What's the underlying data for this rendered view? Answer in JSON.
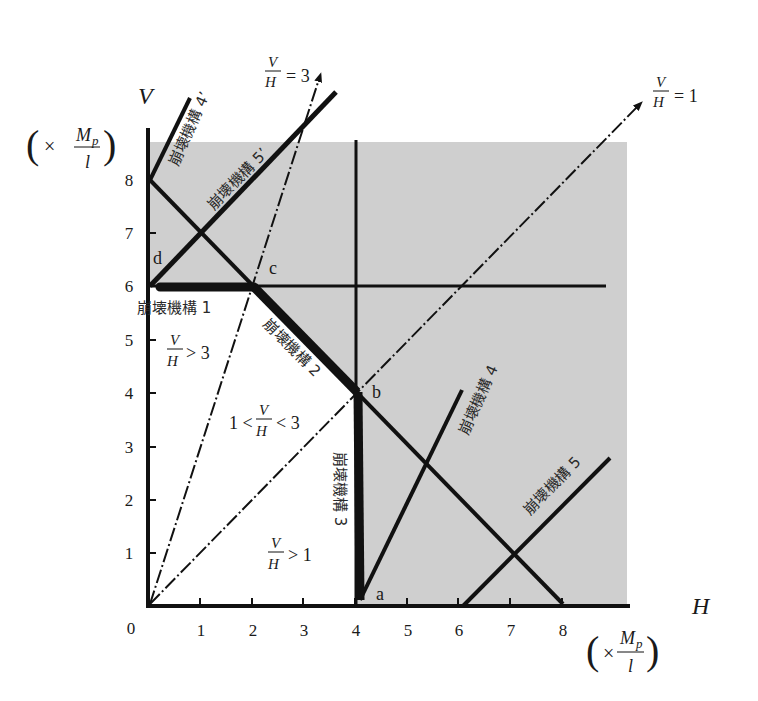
{
  "diagram": {
    "type": "interaction-diagram",
    "axes": {
      "x": {
        "label": "H",
        "unit": "(× Mp / l)",
        "ticks": [
          "0",
          "1",
          "2",
          "3",
          "4",
          "5",
          "6",
          "7",
          "8"
        ]
      },
      "y": {
        "label": "V",
        "unit": "(× Mp / l)",
        "ticks": [
          "1",
          "2",
          "3",
          "4",
          "5",
          "6",
          "7",
          "8"
        ]
      }
    },
    "unit_label": {
      "open": "(",
      "times": "×",
      "num_main": "M",
      "num_sub": "p",
      "den": "l",
      "close": ")"
    },
    "points": {
      "a": "a",
      "b": "b",
      "c": "c",
      "d": "d"
    },
    "mechanisms": {
      "m1": "崩壊機構 1",
      "m2": "崩壊機構 2",
      "m3": "崩壊機構 3",
      "m4": "崩壊機構 4",
      "m5": "崩壊機構 5",
      "m4p": "崩壊機構 4’",
      "m5p": "崩壊機構 5’"
    },
    "ratio_lines": {
      "r3": {
        "num": "V",
        "den": "H",
        "rel": "= 3"
      },
      "r1": {
        "num": "V",
        "den": "H",
        "rel": "= 1"
      }
    },
    "regions": {
      "gt3": {
        "num": "V",
        "den": "H",
        "rel": "> 3"
      },
      "mid": {
        "pre": "1 <",
        "num": "V",
        "den": "H",
        "rel": "< 3"
      },
      "gt1": {
        "num": "V",
        "den": "H",
        "rel": "> 1"
      }
    },
    "colors": {
      "shade": "#cfcfcf",
      "line": "#111111",
      "bg": "#ffffff"
    }
  }
}
